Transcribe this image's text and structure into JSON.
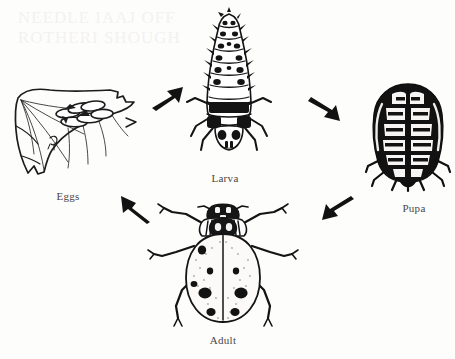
{
  "figure": {
    "background_color": "#fdfdfc",
    "ink_color": "#1a1a1a",
    "label_color": "#4a4744",
    "ghost_text_color": "#f3f2f0"
  },
  "ghost_lines": [
    {
      "text": "NEEDLE IAAJ OFF"
    },
    {
      "text": "ROTHERI SHOUGH"
    }
  ],
  "stages": [
    {
      "id": "eggs",
      "label": "Eggs",
      "icon": "eggs-on-leaf-illustration",
      "description": "Cluster of elongated oval eggs laid on a leaf",
      "label_x": 58,
      "label_y": 190
    },
    {
      "id": "larva",
      "label": "Larva",
      "icon": "larva-illustration",
      "description": "Segmented spiny larva with six legs, viewed from above",
      "label_x": 212,
      "label_y": 172
    },
    {
      "id": "pupa",
      "label": "Pupa",
      "icon": "pupa-illustration",
      "description": "Dark rounded segmented pupa attached to a surface",
      "label_x": 396,
      "label_y": 202
    },
    {
      "id": "adult",
      "label": "Adult",
      "icon": "adult-ladybug-illustration",
      "description": "Adult lady beetle with spotted elytra and six legs",
      "label_x": 203,
      "label_y": 334
    }
  ],
  "arrows": [
    {
      "id": "eggs-to-larva",
      "from": "eggs",
      "to": "larva",
      "direction": "up-right"
    },
    {
      "id": "larva-to-pupa",
      "from": "larva",
      "to": "pupa",
      "direction": "down-right"
    },
    {
      "id": "pupa-to-adult",
      "from": "pupa",
      "to": "adult",
      "direction": "down-left"
    },
    {
      "id": "adult-to-eggs",
      "from": "adult",
      "to": "eggs",
      "direction": "up-left"
    }
  ]
}
